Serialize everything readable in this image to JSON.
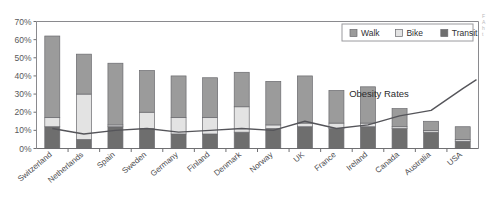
{
  "chart_data": {
    "type": "bar",
    "subtype": "stacked-bar-with-line-overlay",
    "title": "",
    "xlabel": "",
    "ylabel": "",
    "ylim": [
      0,
      70
    ],
    "ytick_labels": [
      "0%",
      "10%",
      "20%",
      "30%",
      "40%",
      "50%",
      "60%",
      "70%"
    ],
    "ytick_values": [
      0,
      10,
      20,
      30,
      40,
      50,
      60,
      70
    ],
    "grid": false,
    "legend_position": "top-right",
    "categories": [
      "Switzerland",
      "Netherlands",
      "Spain",
      "Sweden",
      "Germany",
      "Finland",
      "Denmark",
      "Norway",
      "UK",
      "France",
      "Ireland",
      "Canada",
      "Australia",
      "USA"
    ],
    "series": [
      {
        "name": "Transit",
        "values": [
          12,
          5,
          12,
          11,
          8,
          8,
          9,
          11,
          12,
          11,
          12,
          11,
          9,
          4
        ]
      },
      {
        "name": "Bike",
        "values": [
          5,
          25,
          1,
          9,
          9,
          9,
          14,
          2,
          2,
          3,
          2,
          1,
          1,
          1
        ]
      },
      {
        "name": "Walk",
        "values": [
          45,
          22,
          34,
          23,
          23,
          22,
          19,
          24,
          26,
          18,
          20,
          10,
          5,
          7
        ]
      }
    ],
    "series_totals": [
      62,
      52,
      47,
      43,
      40,
      39,
      42,
      37,
      40,
      32,
      34,
      22,
      15,
      12
    ],
    "overlay_line": {
      "name": "Obesity Rates",
      "values": [
        11,
        8,
        10,
        11,
        9,
        10,
        11,
        10,
        15,
        11,
        13,
        18,
        21,
        33
      ],
      "annotation": "Obesity Rates"
    }
  },
  "legend": {
    "items": [
      {
        "label": "Walk",
        "color": "#9b9b9b"
      },
      {
        "label": "Bike",
        "color": "#e3e3e3"
      },
      {
        "label": "Transit",
        "color": "#6e6e6e"
      }
    ]
  },
  "colors": {
    "walk": "#9b9b9b",
    "bike": "#e3e3e3",
    "transit": "#6e6e6e",
    "line": "#55555a",
    "axis": "#6f6f72",
    "plot_border": "#8a8a8e",
    "text": "#4d4d50"
  },
  "edge_note": {
    "lines": [
      "F",
      "A",
      "h",
      "t"
    ]
  }
}
